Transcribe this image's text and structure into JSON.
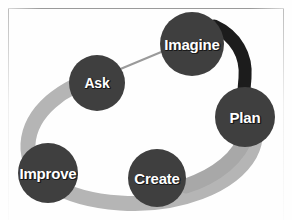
{
  "diagram": {
    "type": "cyclical-process",
    "canvas": {
      "width": 292,
      "height": 220,
      "background": "#fefefe"
    },
    "colors": {
      "node_fill": "#3f3f3f",
      "node_text": "#ffffff",
      "text_shadow": "#1a1a1a",
      "band_light": "#b5b5b5",
      "band_dark": "#1c1c1c",
      "thin_connector": "#9a9a9a",
      "frame_line": "#9a9a9a"
    },
    "nodes": [
      {
        "id": "imagine",
        "label": "Imagine",
        "cx": 192,
        "cy": 44,
        "r": 32,
        "font_size": 15
      },
      {
        "id": "ask",
        "label": "Ask",
        "cx": 97,
        "cy": 83,
        "r": 28,
        "font_size": 14
      },
      {
        "id": "plan",
        "label": "Plan",
        "cx": 245,
        "cy": 117,
        "r": 30,
        "font_size": 15
      },
      {
        "id": "create",
        "label": "Create",
        "cx": 157,
        "cy": 178,
        "r": 29,
        "font_size": 15
      },
      {
        "id": "improve",
        "label": "Improve",
        "cx": 48,
        "cy": 173,
        "r": 30,
        "font_size": 15
      }
    ],
    "connectors": [
      {
        "id": "ask-to-imagine",
        "from": "ask",
        "to": "imagine",
        "style": "thin-line",
        "color": "#9a9a9a"
      },
      {
        "id": "imagine-to-plan",
        "from": "imagine",
        "to": "plan",
        "style": "thick-band-dark",
        "color": "#1c1c1c"
      },
      {
        "id": "plan-to-create",
        "from": "plan",
        "to": "create",
        "style": "thick-band-light",
        "color": "#b5b5b5"
      },
      {
        "id": "create-to-improve",
        "from": "create",
        "to": "improve",
        "style": "thick-band-light",
        "color": "#b5b5b5"
      },
      {
        "id": "improve-to-ask",
        "from": "improve",
        "to": "ask",
        "style": "thick-band-light",
        "color": "#b5b5b5"
      }
    ]
  },
  "frame": {
    "top_rule": "",
    "left_rule": "",
    "right_rule": ""
  }
}
